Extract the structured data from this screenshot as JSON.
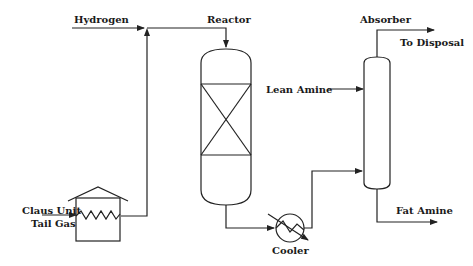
{
  "diagram": {
    "type": "process-flow",
    "labels": {
      "hydrogen": "Hydrogen",
      "reactor": "Reactor",
      "absorber": "Absorber",
      "to_disposal": "To Disposal",
      "lean_amine": "Lean Amine",
      "claus_line1": "Claus Unit",
      "claus_line2": "Tail Gas",
      "cooler": "Cooler",
      "fat_amine": "Fat Amine"
    },
    "units": [
      {
        "name": "Heater",
        "kind": "fired-heater"
      },
      {
        "name": "Reactor",
        "kind": "packed-vessel"
      },
      {
        "name": "Cooler",
        "kind": "heat-exchanger"
      },
      {
        "name": "Absorber",
        "kind": "column"
      }
    ],
    "streams": [
      {
        "from": "Claus Unit Tail Gas",
        "to": "Heater"
      },
      {
        "from": "Heater",
        "to": "Reactor"
      },
      {
        "from": "Hydrogen",
        "to": "Reactor"
      },
      {
        "from": "Reactor",
        "to": "Cooler"
      },
      {
        "from": "Cooler",
        "to": "Absorber"
      },
      {
        "from": "Lean Amine",
        "to": "Absorber"
      },
      {
        "from": "Absorber",
        "to": "To Disposal"
      },
      {
        "from": "Absorber",
        "to": "Fat Amine"
      }
    ],
    "colors": {
      "line": "#222222",
      "background": "#ffffff"
    }
  }
}
